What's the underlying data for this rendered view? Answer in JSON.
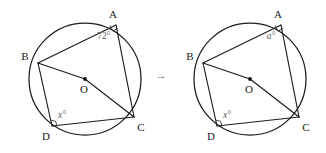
{
  "figure": {
    "kind": "geometry-diagram",
    "transition_arrow": "→",
    "stroke_color": "#1b1b1b",
    "label_color": "#1b1b1b",
    "angle_label_color": "#5b5b5b",
    "panels": [
      {
        "id": "left",
        "name": "left-diagram",
        "vertices": [
          {
            "key": "A",
            "label": "A"
          },
          {
            "key": "B",
            "label": "B"
          },
          {
            "key": "C",
            "label": "C"
          },
          {
            "key": "D",
            "label": "D"
          },
          {
            "key": "O",
            "label": "O"
          }
        ],
        "angles": [
          {
            "at": "A",
            "label": "72°",
            "style": "upright"
          },
          {
            "at": "D",
            "label": "x°",
            "style": "italic"
          }
        ],
        "right_angle_marks": [
          "A",
          "D"
        ]
      },
      {
        "id": "right",
        "name": "right-diagram",
        "vertices": [
          {
            "key": "A",
            "label": "A"
          },
          {
            "key": "B",
            "label": "B"
          },
          {
            "key": "C",
            "label": "C"
          },
          {
            "key": "D",
            "label": "D"
          },
          {
            "key": "O",
            "label": "O"
          }
        ],
        "angles": [
          {
            "at": "A",
            "label": "a°",
            "style": "italic"
          },
          {
            "at": "D",
            "label": "x°",
            "style": "italic"
          }
        ],
        "right_angle_marks": [
          "A",
          "D"
        ]
      }
    ]
  }
}
